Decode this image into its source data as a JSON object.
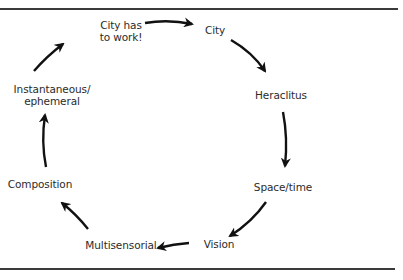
{
  "diagram": {
    "type": "cycle",
    "direction": "clockwise",
    "nodes": [
      {
        "id": "city-has-to-work",
        "lines": [
          "City has",
          "to work!"
        ]
      },
      {
        "id": "city",
        "lines": [
          "City"
        ]
      },
      {
        "id": "heraclitus",
        "lines": [
          "Heraclitus"
        ]
      },
      {
        "id": "space-time",
        "lines": [
          "Space/time"
        ]
      },
      {
        "id": "vision",
        "lines": [
          "Vision"
        ]
      },
      {
        "id": "multisensorial",
        "lines": [
          "Multisensorial"
        ]
      },
      {
        "id": "composition",
        "lines": [
          "Composition"
        ]
      },
      {
        "id": "instantaneous-ephemeral",
        "lines": [
          "Instantaneous/",
          "ephemeral"
        ]
      }
    ],
    "edges": [
      {
        "from": "city-has-to-work",
        "to": "city"
      },
      {
        "from": "city",
        "to": "heraclitus"
      },
      {
        "from": "heraclitus",
        "to": "space-time"
      },
      {
        "from": "space-time",
        "to": "vision"
      },
      {
        "from": "vision",
        "to": "multisensorial"
      },
      {
        "from": "multisensorial",
        "to": "composition"
      },
      {
        "from": "composition",
        "to": "instantaneous-ephemeral"
      },
      {
        "from": "instantaneous-ephemeral",
        "to": "city-has-to-work"
      }
    ],
    "colors": {
      "text": "#2b2b2b",
      "arrow": "#111111",
      "rule": "#3a3a3a",
      "background": "#ffffff"
    }
  }
}
